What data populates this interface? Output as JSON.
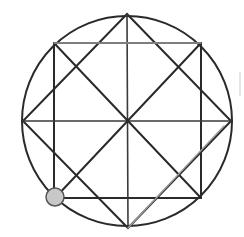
{
  "diagram": {
    "title": "",
    "elements": [
      "circle",
      "square",
      "diamond",
      "horizontal-diameter",
      "vertical-diameter",
      "square-diagonal-1",
      "square-diagonal-2",
      "extra-chord",
      "marker-point"
    ],
    "colors": {
      "stroke": "#2a2a2a",
      "light_stroke": "#9a9a9a",
      "marker_fill": "#c8c8c8",
      "marker_stroke": "#555555"
    }
  }
}
